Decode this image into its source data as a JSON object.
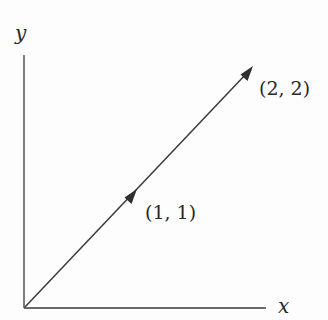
{
  "diagram": {
    "type": "vector-plot",
    "axes": {
      "x_label": "x",
      "y_label": "y"
    },
    "vector": {
      "from": [
        0,
        0
      ],
      "to": [
        2,
        2
      ]
    },
    "points": [
      {
        "label": "(1, 1)",
        "coords": [
          1,
          1
        ]
      },
      {
        "label": "(2, 2)",
        "coords": [
          2,
          2
        ]
      }
    ],
    "colors": {
      "stroke": "#3a3a3a",
      "text": "#2a2a2a",
      "background": "#fdfdfd"
    }
  }
}
